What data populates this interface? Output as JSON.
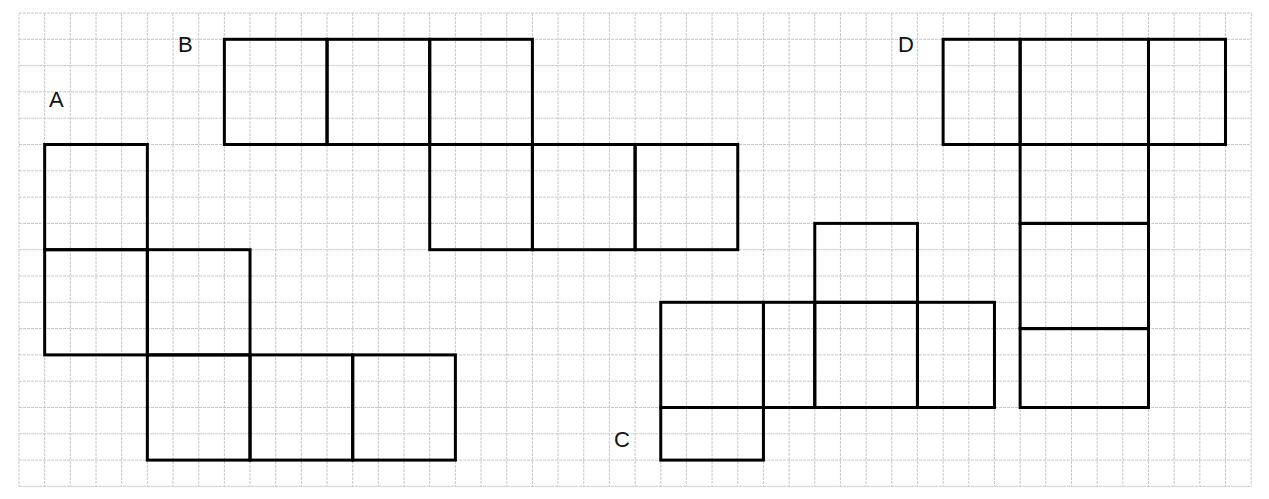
{
  "diagram": {
    "grid": {
      "origin_x": 19,
      "origin_y": 13,
      "unit_x": 25.67,
      "unit_y": 26.3,
      "cols": 48,
      "rows": 18,
      "line_color": "#c8c8c8",
      "border_color": "#bdbdbd"
    },
    "stroke_color": "#000000",
    "stroke_width": 3,
    "nets": [
      {
        "id": "A",
        "label": "A",
        "label_pos": [
          49,
          99
        ],
        "rects": [
          [
            1,
            5,
            4,
            4
          ],
          [
            1,
            9,
            4,
            4
          ],
          [
            5,
            9,
            4,
            4
          ],
          [
            5,
            13,
            4,
            4
          ],
          [
            9,
            13,
            4,
            4
          ],
          [
            13,
            13,
            4,
            4
          ]
        ]
      },
      {
        "id": "B",
        "label": "B",
        "label_pos": [
          178,
          44
        ],
        "rects": [
          [
            8,
            1,
            4,
            4
          ],
          [
            12,
            1,
            4,
            4
          ],
          [
            16,
            1,
            4,
            4
          ],
          [
            16,
            5,
            4,
            4
          ],
          [
            20,
            5,
            4,
            4
          ],
          [
            24,
            5,
            4,
            4
          ]
        ]
      },
      {
        "id": "C",
        "label": "C",
        "label_pos": [
          614,
          439
        ],
        "rects": [
          [
            31,
            8,
            4,
            3
          ],
          [
            25,
            11,
            4,
            4
          ],
          [
            29,
            11,
            2,
            4
          ],
          [
            31,
            11,
            4,
            4
          ],
          [
            35,
            11,
            3,
            4
          ],
          [
            25,
            15,
            4,
            2
          ]
        ]
      },
      {
        "id": "D",
        "label": "D",
        "label_pos": [
          898,
          44
        ],
        "rects": [
          [
            36,
            1,
            3,
            4
          ],
          [
            39,
            1,
            5,
            4
          ],
          [
            44,
            1,
            3,
            4
          ],
          [
            39,
            5,
            5,
            3
          ],
          [
            39,
            8,
            5,
            4
          ],
          [
            39,
            12,
            5,
            3
          ]
        ]
      }
    ]
  }
}
